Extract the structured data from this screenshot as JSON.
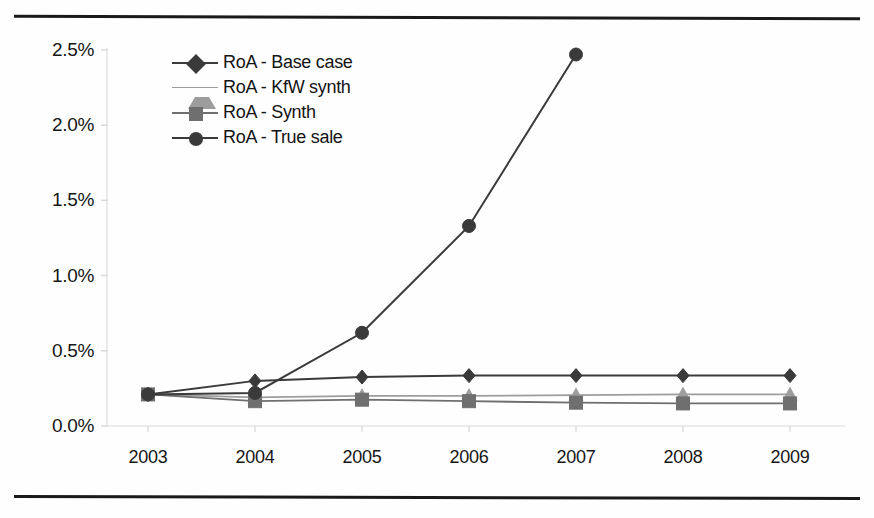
{
  "figure": {
    "top_rule": "horizontal-rule",
    "bottom_rule": "horizontal-rule"
  },
  "chart_data": {
    "type": "line",
    "title": "",
    "subtitle": "",
    "xlabel": "",
    "ylabel": "",
    "categories": [
      "2003",
      "2004",
      "2005",
      "2006",
      "2007",
      "2008",
      "2009"
    ],
    "ylim": [
      0.0,
      2.5
    ],
    "ytick_labels": [
      "0.0%",
      "0.5%",
      "1.0%",
      "1.5%",
      "2.0%",
      "2.5%"
    ],
    "ytick_values": [
      0.0,
      0.5,
      1.0,
      1.5,
      2.0,
      2.5
    ],
    "grid": false,
    "legend_position": "upper-left-inside",
    "value_suffix": "%",
    "series": [
      {
        "name": "RoA - Base case",
        "marker": "diamond",
        "color": "#3a3a3a",
        "values": [
          0.21,
          0.3,
          0.325,
          0.335,
          0.335,
          0.335,
          0.335
        ]
      },
      {
        "name": "RoA - KfW synth",
        "marker": "triangle",
        "color": "#9d9d9d",
        "values": [
          0.21,
          0.19,
          0.2,
          0.2,
          0.205,
          0.21,
          0.21
        ]
      },
      {
        "name": "RoA - Synth",
        "marker": "square",
        "color": "#6f6f6f",
        "values": [
          0.21,
          0.165,
          0.175,
          0.165,
          0.155,
          0.15,
          0.15
        ]
      },
      {
        "name": "RoA - True sale",
        "marker": "circle",
        "color": "#3a3a3a",
        "values": [
          0.21,
          0.22,
          0.62,
          1.33,
          2.47,
          null,
          null
        ]
      }
    ]
  }
}
